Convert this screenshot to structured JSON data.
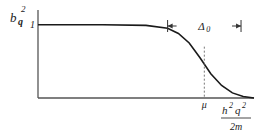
{
  "chart_data": {
    "type": "line",
    "title": "",
    "ylabel": "b_q^2",
    "ylabel_parts": {
      "base": "b",
      "sub": "q",
      "sup": "2"
    },
    "xlabel_numerator": "ħ²q²",
    "xlabel_numerator_parts": {
      "h": "h",
      "h_sup": "2",
      "q": "q",
      "q_sup": "2"
    },
    "xlabel_denominator": "2m",
    "y_tick_labels": [
      "1"
    ],
    "x_tick_labels": [
      "μ"
    ],
    "annotation": {
      "text": "Δ",
      "sub": "0",
      "meaning": "width of transition region"
    },
    "series": [
      {
        "name": "b_q^2",
        "description": "smoothed step: 1 well below μ, falling through about 0.5 at μ, to 0 above",
        "x": [
          0,
          0.3,
          0.5,
          0.6,
          0.65,
          0.7,
          0.75,
          0.8,
          0.85,
          0.9,
          0.95,
          1.0
        ],
        "values": [
          1.0,
          1.0,
          0.99,
          0.95,
          0.88,
          0.75,
          0.55,
          0.33,
          0.17,
          0.07,
          0.02,
          0.0
        ]
      }
    ],
    "mu_x": 0.77,
    "delta_range": [
      0.6,
      0.94
    ],
    "ylim": [
      0,
      1.2
    ],
    "xlim": [
      0,
      1.0
    ],
    "grid": false
  }
}
